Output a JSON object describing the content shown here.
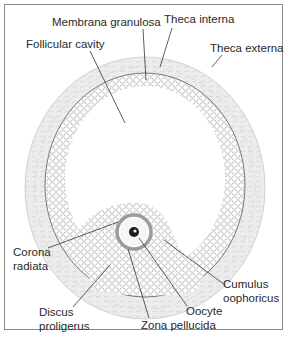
{
  "diagram": {
    "labels": {
      "membrana_granulosa": "Membrana granulosa",
      "theca_interna": "Theca interna",
      "theca_externa": "Theca externa",
      "follicular_cavity": "Follicular cavity",
      "corona_radiata": "Corona\nradiata",
      "cumulus_oophoricus": "Cumulus\noophoricus",
      "discus_proligerus": "Discus\nproligerus",
      "oocyte": "Oocyte",
      "zona_pellucida": "Zona pellucida"
    },
    "colors": {
      "theca": "#e4e4e4",
      "granulosa_cell": "#9a9a9a",
      "line": "#333333",
      "zona": "#9c9c9c"
    }
  }
}
